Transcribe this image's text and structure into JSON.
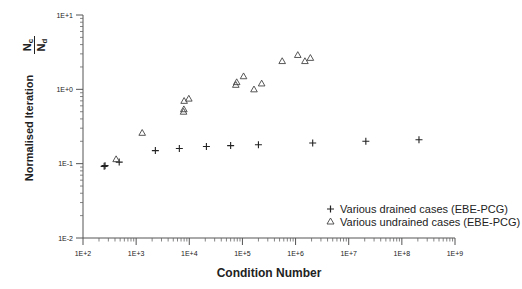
{
  "chart_data": {
    "type": "scatter",
    "title": "",
    "xlabel": "Condition Number",
    "ylabel": "Normalised Iteration",
    "ylabel_fraction": {
      "numerator": "N",
      "numerator_sub": "c",
      "denominator": "N",
      "denominator_sub": "d"
    },
    "xscale": "log",
    "yscale": "log",
    "xlim": [
      100,
      1000000000
    ],
    "ylim": [
      0.01,
      10
    ],
    "x_ticks": [
      "1E+2",
      "1E+3",
      "1E+4",
      "1E+5",
      "1E+6",
      "1E+7",
      "1E+8",
      "1E+9"
    ],
    "y_ticks": [
      "1E-2",
      "1E-1",
      "1E+0",
      "1E+1"
    ],
    "grid": false,
    "legend_position": "lower right",
    "series": [
      {
        "name": "Various drained cases (EBE-PCG)",
        "marker": "+",
        "points": [
          [
            250,
            0.092
          ],
          [
            260,
            0.094
          ],
          [
            480,
            0.105
          ],
          [
            2300,
            0.15
          ],
          [
            6500,
            0.16
          ],
          [
            21000,
            0.17
          ],
          [
            60000,
            0.175
          ],
          [
            200000,
            0.18
          ],
          [
            2100000,
            0.19
          ],
          [
            21000000,
            0.2
          ],
          [
            210000000,
            0.21
          ]
        ]
      },
      {
        "name": "Various undrained cases (EBE-PCG)",
        "marker": "triangle",
        "points": [
          [
            420,
            0.115
          ],
          [
            1300,
            0.26
          ],
          [
            7800,
            0.5
          ],
          [
            7900,
            0.54
          ],
          [
            8000,
            0.7
          ],
          [
            9800,
            0.75
          ],
          [
            75000,
            1.15
          ],
          [
            78000,
            1.25
          ],
          [
            105000,
            1.5
          ],
          [
            165000,
            1.0
          ],
          [
            230000,
            1.2
          ],
          [
            560000,
            2.4
          ],
          [
            1100000,
            2.9
          ],
          [
            1500000,
            2.4
          ],
          [
            1900000,
            2.65
          ]
        ]
      }
    ]
  },
  "legend": {
    "items": [
      {
        "symbol": "+",
        "label": "Various drained cases (EBE-PCG)"
      },
      {
        "symbol": "△",
        "label": "Various undrained cases (EBE-PCG)"
      }
    ]
  }
}
